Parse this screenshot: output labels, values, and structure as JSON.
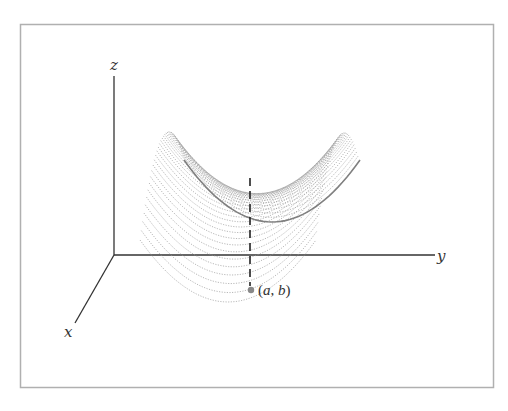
{
  "figure": {
    "axes": {
      "x_label": "x",
      "y_label": "y",
      "z_label": "z"
    },
    "point": {
      "label_open": "(",
      "label_a": "a",
      "label_sep": ", ",
      "label_b": "b",
      "label_close": ")",
      "full_label": "(a, b)"
    },
    "colors": {
      "frame": "#b0b0b0",
      "axes": "#333333",
      "surface_lines": "#9a9a9a",
      "surface_edge": "#808080",
      "point": "#888888",
      "dashed_line": "#222222"
    }
  }
}
